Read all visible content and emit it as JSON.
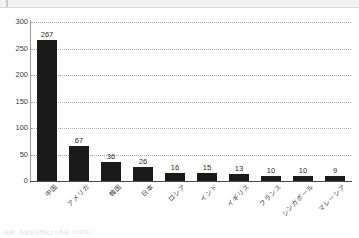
{
  "top_bar": {
    "present": true
  },
  "footnote": {
    "text": "出典：各国統計資料より作成（2020年）"
  },
  "chart_data": {
    "type": "bar",
    "title": "",
    "xlabel": "",
    "ylabel": "",
    "ylim": [
      0,
      300
    ],
    "yticks": [
      300,
      250,
      200,
      150,
      100,
      50,
      0
    ],
    "grid": true,
    "legend": "none",
    "bar_color": "#1a1a1a",
    "grid_color": "#a8a8a8",
    "axis_color": "#4a4a4a",
    "categories": [
      "中国",
      "アメリカ",
      "韓国",
      "日本",
      "ロシア",
      "インド",
      "イギリス",
      "フランス",
      "シンガポール",
      "マレーシア"
    ],
    "values": [
      267,
      67,
      36,
      26,
      16,
      15,
      13,
      10,
      10,
      9
    ],
    "value_labels": [
      "267",
      "67",
      "36",
      "26",
      "16",
      "15",
      "13",
      "10",
      "10",
      "9"
    ],
    "tick_labels": [
      "300",
      "250",
      "200",
      "150",
      "100",
      "50",
      "0"
    ]
  }
}
